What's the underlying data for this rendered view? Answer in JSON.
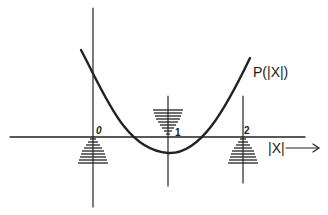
{
  "diagram": {
    "curve_label": "P(|X|)",
    "axis_label": "|X|",
    "tick_labels": [
      "0",
      "1",
      "2"
    ],
    "colors": {
      "ink": "#222222",
      "background": "#ffffff"
    },
    "markers": [
      {
        "position": "0",
        "shape": "triangle-up",
        "placement": "below-axis"
      },
      {
        "position": "1",
        "shape": "triangle-down",
        "placement": "above-axis"
      },
      {
        "position": "2",
        "shape": "triangle-up",
        "placement": "below-axis"
      }
    ]
  }
}
